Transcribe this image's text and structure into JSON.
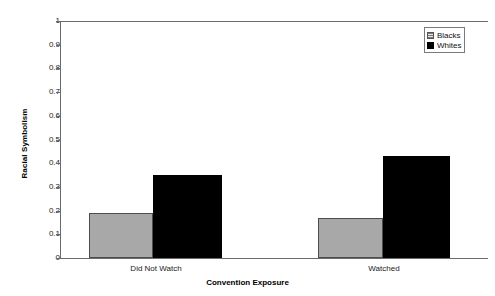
{
  "chart_data": {
    "type": "bar",
    "title": "",
    "subtitle": "",
    "xlabel": "Convention Exposure",
    "ylabel": "Racial Symbolism",
    "categories": [
      "Did Not Watch",
      "Watched"
    ],
    "series": [
      {
        "name": "Blacks",
        "values": [
          0.19,
          0.17
        ],
        "color": "#a8a8a8"
      },
      {
        "name": "Whites",
        "values": [
          0.35,
          0.43
        ],
        "color": "#000000"
      }
    ],
    "ylim": [
      0,
      1
    ],
    "ytick_labels": [
      "1",
      "0.9",
      "0.8",
      "0.7",
      "0.6",
      "0.5",
      "0.4",
      "0.3",
      "0.2",
      "0.1",
      "0"
    ],
    "ytick_values": [
      1,
      0.9,
      0.8,
      0.7,
      0.6,
      0.5,
      0.4,
      0.3,
      0.2,
      0.1,
      0
    ],
    "grid": false,
    "legend_position": "top-right",
    "legend_entries": [
      "Blacks",
      "Whites"
    ]
  },
  "axes": {
    "y_title": "Racial Symbolism",
    "x_title": "Convention Exposure",
    "y_ticks": {
      "t0": "1",
      "t1": "0.9",
      "t2": "0.8",
      "t3": "0.7",
      "t4": "0.6",
      "t5": "0.5",
      "t6": "0.4",
      "t7": "0.3",
      "t8": "0.2",
      "t9": "0.1",
      "t10": "0"
    },
    "x_categories": {
      "c0": "Did Not Watch",
      "c1": "Watched"
    }
  },
  "legend": {
    "blacks_label": "Blacks",
    "whites_label": "Whites"
  }
}
